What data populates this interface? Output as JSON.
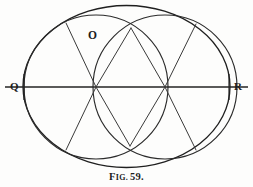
{
  "figure": {
    "caption": {
      "prefix_initial": "F",
      "prefix_rest": "IG.",
      "number": "59."
    },
    "labels": [
      {
        "id": "Q",
        "text": "Q",
        "x": 10,
        "y": 81,
        "role": "left-axis-endpoint"
      },
      {
        "id": "R",
        "text": "R",
        "x": 234,
        "y": 81,
        "role": "right-axis-endpoint"
      },
      {
        "id": "O",
        "text": "O",
        "x": 88,
        "y": 30,
        "role": "center-point"
      }
    ],
    "colors": {
      "ink": "#2b2b2b",
      "ink_heavy": "#1f1f1f",
      "paper": "#fdfdfc"
    },
    "geometry": {
      "outer_ellipse": {
        "cx": 126.5,
        "cy": 86.5,
        "rx": 103.5,
        "ry": 81.0
      },
      "left_circle": {
        "cx": 96.0,
        "cy": 87.0,
        "r": 72.0
      },
      "right_circle": {
        "cx": 165.0,
        "cy": 87.0,
        "r": 72.0
      },
      "axis": {
        "x1": 5,
        "y1": 87,
        "x2": 248,
        "y2": 87
      },
      "nodes": [
        {
          "id": "left-node",
          "x": 96,
          "y": 87
        },
        {
          "id": "right-node",
          "x": 165,
          "y": 87
        },
        {
          "id": "top-vesica",
          "x": 131,
          "y": 28
        },
        {
          "id": "bottom-vesica",
          "x": 130,
          "y": 146
        }
      ],
      "chords": [
        {
          "from": [
            96,
            87
          ],
          "to": [
            66,
            23
          ]
        },
        {
          "from": [
            96,
            87
          ],
          "to": [
            131,
            28
          ]
        },
        {
          "from": [
            96,
            87
          ],
          "to": [
            130,
            146
          ]
        },
        {
          "from": [
            96,
            87
          ],
          "to": [
            66,
            150
          ]
        },
        {
          "from": [
            165,
            87
          ],
          "to": [
            131,
            28
          ]
        },
        {
          "from": [
            165,
            87
          ],
          "to": [
            196,
            24
          ]
        },
        {
          "from": [
            165,
            87
          ],
          "to": [
            196,
            150
          ]
        },
        {
          "from": [
            165,
            87
          ],
          "to": [
            130,
            146
          ]
        }
      ]
    }
  }
}
